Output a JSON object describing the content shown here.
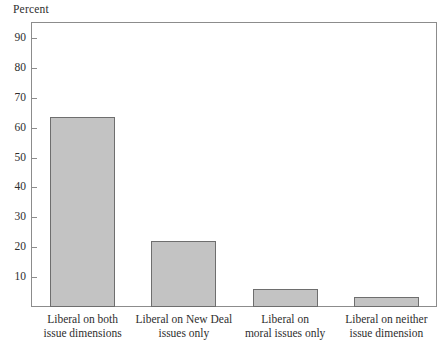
{
  "chart_data": {
    "type": "bar",
    "title": "",
    "ylabel": "Percent",
    "xlabel": "",
    "categories": [
      "Liberal on both issue dimensions",
      "Liberal on New Deal issues only",
      "Liberal on moral issues only",
      "Liberal on neither issue dimension"
    ],
    "category_lines": [
      [
        "Liberal on both",
        "issue dimensions"
      ],
      [
        "Liberal on New Deal",
        "issues only"
      ],
      [
        "Liberal on",
        "moral issues only"
      ],
      [
        "Liberal on neither",
        "issue dimension"
      ]
    ],
    "values": [
      63.5,
      22,
      6,
      3.5
    ],
    "ylim": [
      0,
      95
    ],
    "yticks": [
      10,
      20,
      30,
      40,
      50,
      60,
      70,
      80,
      90
    ],
    "ytick_labels": [
      "10",
      "20",
      "30",
      "40",
      "50",
      "60",
      "70",
      "80",
      "90"
    ],
    "grid": false,
    "legend": null,
    "bar_fill_color": "#c3c3c3",
    "bar_edge_color": "#6e6e6e",
    "axis_color": "#8c8c8c",
    "text_color": "#2e2e2e"
  }
}
